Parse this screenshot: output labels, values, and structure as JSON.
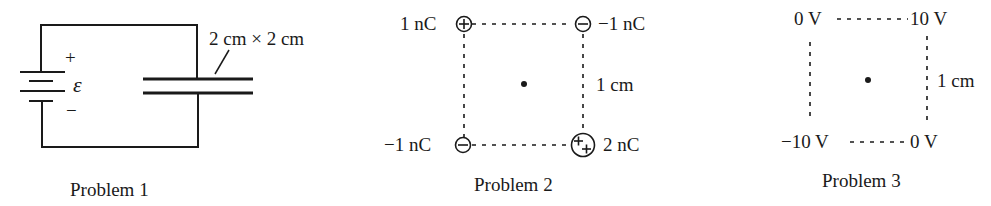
{
  "problem1": {
    "caption": "Problem 1",
    "plate_size_label": "2 cm × 2 cm",
    "emf_symbol": "ε",
    "plus_label": "+",
    "minus_label": "−",
    "components": [
      "battery",
      "parallel-plate-capacitor"
    ]
  },
  "problem2": {
    "caption": "Problem 2",
    "charges": [
      {
        "position": "top-left",
        "label": "1 nC",
        "sign": "positive"
      },
      {
        "position": "top-right",
        "label": "−1 nC",
        "sign": "negative"
      },
      {
        "position": "bottom-left",
        "label": "−1 nC",
        "sign": "negative"
      },
      {
        "position": "bottom-right",
        "label": "2 nC",
        "sign": "double-positive"
      }
    ],
    "side_label": "1 cm"
  },
  "problem3": {
    "caption": "Problem 3",
    "potentials": [
      {
        "position": "top-left",
        "label": "0 V"
      },
      {
        "position": "top-right",
        "label": "10 V"
      },
      {
        "position": "bottom-left",
        "label": "−10 V"
      },
      {
        "position": "bottom-right",
        "label": "0 V"
      }
    ],
    "side_label": "1 cm"
  }
}
